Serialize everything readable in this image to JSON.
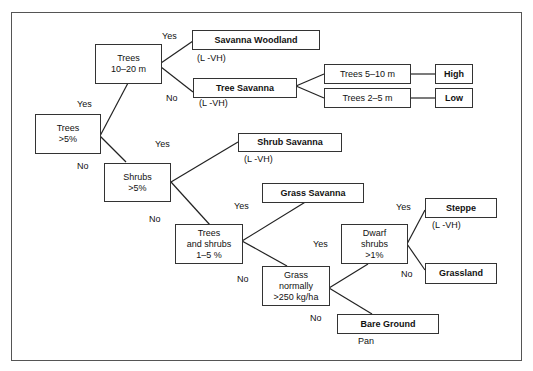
{
  "diagram": {
    "nodes": {
      "trees_5": "Trees\n>5%",
      "trees_10_20": "Trees\n10–20 m",
      "savanna_woodland": "Savanna Woodland",
      "tree_savanna": "Tree Savanna",
      "trees_5_10": "Trees 5–10 m",
      "trees_2_5": "Trees 2–5 m",
      "high": "High",
      "low": "Low",
      "shrubs_5": "Shrubs\n>5%",
      "shrub_savanna": "Shrub Savanna",
      "trees_shrubs_1_5": "Trees\nand shrubs\n1–5 %",
      "grass_savanna": "Grass Savanna",
      "grass_250": "Grass\nnormally\n>250 kg/ha",
      "dwarf_shrubs": "Dwarf\nshrubs\n>1%",
      "steppe": "Steppe",
      "grassland": "Grassland",
      "bare_ground": "Bare Ground"
    },
    "annotations": {
      "savanna_woodland": "(L -VH)",
      "tree_savanna": "(L -VH)",
      "shrub_savanna": "(L -VH)",
      "steppe": "(L -VH)",
      "bare_ground": "Pan"
    },
    "edge_labels": {
      "yes": "Yes",
      "no": "No"
    }
  }
}
